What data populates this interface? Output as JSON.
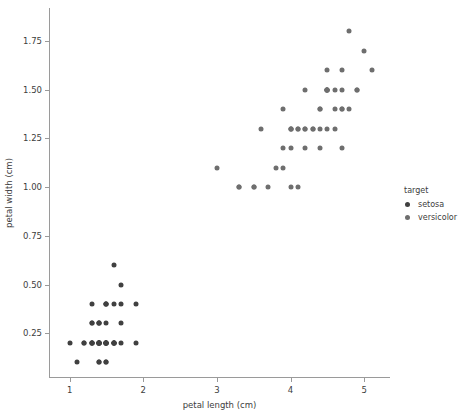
{
  "chart_data": {
    "type": "scatter",
    "title": "",
    "xlabel": "petal length (cm)",
    "ylabel": "petal width (cm)",
    "xlim": [
      0.72,
      5.35
    ],
    "ylim": [
      0.02,
      1.92
    ],
    "xticks": [
      1,
      2,
      3,
      4,
      5
    ],
    "xtick_labels": [
      "1",
      "2",
      "3",
      "4",
      "5"
    ],
    "yticks": [
      0.25,
      0.5,
      0.75,
      1.0,
      1.25,
      1.5,
      1.75
    ],
    "ytick_labels": [
      "0.25",
      "0.50",
      "0.75",
      "1.00",
      "1.25",
      "1.50",
      "1.75"
    ],
    "grid": false,
    "legend": {
      "title": "target",
      "position": "right",
      "entries": [
        {
          "name": "setosa",
          "color": "#404040"
        },
        {
          "name": "versicolor",
          "color": "#6e6e6e"
        }
      ]
    },
    "series": [
      {
        "name": "setosa",
        "color": "#404040",
        "points": [
          [
            1.4,
            0.2
          ],
          [
            1.4,
            0.2
          ],
          [
            1.3,
            0.2
          ],
          [
            1.5,
            0.2
          ],
          [
            1.4,
            0.2
          ],
          [
            1.7,
            0.4
          ],
          [
            1.4,
            0.3
          ],
          [
            1.5,
            0.2
          ],
          [
            1.4,
            0.2
          ],
          [
            1.5,
            0.1
          ],
          [
            1.5,
            0.2
          ],
          [
            1.6,
            0.2
          ],
          [
            1.4,
            0.1
          ],
          [
            1.1,
            0.1
          ],
          [
            1.2,
            0.2
          ],
          [
            1.5,
            0.4
          ],
          [
            1.3,
            0.4
          ],
          [
            1.4,
            0.3
          ],
          [
            1.7,
            0.3
          ],
          [
            1.5,
            0.3
          ],
          [
            1.7,
            0.2
          ],
          [
            1.5,
            0.4
          ],
          [
            1.0,
            0.2
          ],
          [
            1.7,
            0.5
          ],
          [
            1.9,
            0.2
          ],
          [
            1.6,
            0.2
          ],
          [
            1.6,
            0.4
          ],
          [
            1.5,
            0.2
          ],
          [
            1.4,
            0.2
          ],
          [
            1.6,
            0.2
          ],
          [
            1.6,
            0.2
          ],
          [
            1.5,
            0.4
          ],
          [
            1.5,
            0.1
          ],
          [
            1.4,
            0.2
          ],
          [
            1.5,
            0.2
          ],
          [
            1.2,
            0.2
          ],
          [
            1.3,
            0.2
          ],
          [
            1.4,
            0.1
          ],
          [
            1.3,
            0.2
          ],
          [
            1.5,
            0.2
          ],
          [
            1.3,
            0.3
          ],
          [
            1.3,
            0.3
          ],
          [
            1.3,
            0.2
          ],
          [
            1.6,
            0.6
          ],
          [
            1.9,
            0.4
          ],
          [
            1.4,
            0.3
          ],
          [
            1.6,
            0.2
          ],
          [
            1.4,
            0.2
          ],
          [
            1.5,
            0.2
          ],
          [
            1.4,
            0.2
          ]
        ]
      },
      {
        "name": "versicolor",
        "color": "#6e6e6e",
        "points": [
          [
            4.7,
            1.4
          ],
          [
            4.5,
            1.5
          ],
          [
            4.9,
            1.5
          ],
          [
            4.0,
            1.3
          ],
          [
            4.6,
            1.5
          ],
          [
            4.5,
            1.3
          ],
          [
            4.7,
            1.6
          ],
          [
            3.3,
            1.0
          ],
          [
            4.6,
            1.3
          ],
          [
            3.9,
            1.4
          ],
          [
            3.5,
            1.0
          ],
          [
            4.2,
            1.5
          ],
          [
            4.0,
            1.0
          ],
          [
            4.7,
            1.4
          ],
          [
            3.6,
            1.3
          ],
          [
            4.4,
            1.4
          ],
          [
            4.5,
            1.5
          ],
          [
            4.1,
            1.0
          ],
          [
            4.5,
            1.5
          ],
          [
            3.9,
            1.1
          ],
          [
            4.8,
            1.8
          ],
          [
            4.0,
            1.3
          ],
          [
            4.9,
            1.5
          ],
          [
            4.7,
            1.2
          ],
          [
            4.3,
            1.3
          ],
          [
            4.4,
            1.4
          ],
          [
            4.8,
            1.4
          ],
          [
            5.0,
            1.7
          ],
          [
            4.5,
            1.5
          ],
          [
            3.5,
            1.0
          ],
          [
            3.8,
            1.1
          ],
          [
            3.7,
            1.0
          ],
          [
            3.9,
            1.2
          ],
          [
            5.1,
            1.6
          ],
          [
            4.5,
            1.5
          ],
          [
            4.5,
            1.6
          ],
          [
            4.7,
            1.5
          ],
          [
            4.4,
            1.3
          ],
          [
            4.1,
            1.3
          ],
          [
            4.0,
            1.3
          ],
          [
            4.4,
            1.2
          ],
          [
            4.6,
            1.4
          ],
          [
            4.0,
            1.2
          ],
          [
            3.3,
            1.0
          ],
          [
            4.2,
            1.3
          ],
          [
            4.2,
            1.2
          ],
          [
            4.2,
            1.3
          ],
          [
            4.3,
            1.3
          ],
          [
            3.0,
            1.1
          ],
          [
            4.1,
            1.3
          ]
        ]
      }
    ]
  }
}
